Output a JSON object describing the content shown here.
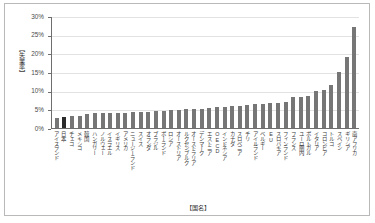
{
  "chart_data": {
    "type": "bar",
    "title": "",
    "xlabel": "【国名】",
    "ylabel": "【失業率】",
    "ylim": [
      0,
      0.3
    ],
    "ytick_labels": [
      "0%",
      "5%",
      "10%",
      "15%",
      "20%",
      "25%",
      "30%"
    ],
    "ytick_values": [
      0,
      5,
      10,
      15,
      20,
      25,
      30
    ],
    "grid": true,
    "legend": "none",
    "highlight_category": "日本",
    "series_name": "失業率",
    "bar_color": "#767676",
    "highlight_color": "#2b2b2b",
    "categories": [
      "アイスランド",
      "日本",
      "チェコ",
      "メキシコ",
      "韓国",
      "ハンガリー",
      "ノルウェー",
      "イスラエル",
      "イギリス",
      "アメリカ",
      "ニュージーランド",
      "スイス",
      "オランダ",
      "ブラジル",
      "ポーランド",
      "ロシア",
      "オーストリア",
      "ルクセンブルク",
      "オーストラリア",
      "デンマーク",
      "エストニア",
      "OECD",
      "インドネシア",
      "カナダ",
      "スロベニア",
      "チリ",
      "アイルランド",
      "ベルギー",
      "EU",
      "スロバキア",
      "フィンランド",
      "フランス",
      "ユーロ圏内",
      "ポルトガル",
      "イタリア",
      "コロンビア",
      "トルコ",
      "スペイン",
      "ギリシア",
      "南アフリカ"
    ],
    "values": [
      2.8,
      2.9,
      3.1,
      3.3,
      3.8,
      3.9,
      3.9,
      4.0,
      4.1,
      4.1,
      4.2,
      4.3,
      4.4,
      4.5,
      4.6,
      4.7,
      4.8,
      5.0,
      5.1,
      5.2,
      5.4,
      5.5,
      5.6,
      5.8,
      6.0,
      6.2,
      6.3,
      6.4,
      6.6,
      6.8,
      7.0,
      8.2,
      8.4,
      8.6,
      10.0,
      10.2,
      11.5,
      15.0,
      19.0,
      27.0
    ],
    "value_unit": "%"
  }
}
